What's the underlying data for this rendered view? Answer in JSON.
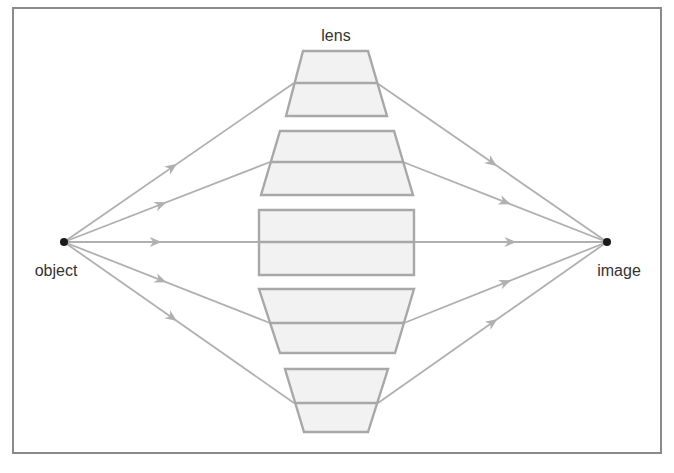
{
  "diagram": {
    "labels": {
      "lens": "lens",
      "object": "object",
      "image": "image"
    },
    "colors": {
      "frame": "#8a8a8a",
      "lens_fill": "#f2f2f2",
      "lens_stroke": "#a8a8a8",
      "ray": "#b0b0b0",
      "point": "#1a1a1a",
      "text": "#333333"
    },
    "lens_segments": [
      {
        "name": "lens-segment-1",
        "shape": "trapezoid-narrow-top"
      },
      {
        "name": "lens-segment-2",
        "shape": "trapezoid-narrow-top"
      },
      {
        "name": "lens-segment-3",
        "shape": "rectangle"
      },
      {
        "name": "lens-segment-4",
        "shape": "trapezoid-narrow-bottom"
      },
      {
        "name": "lens-segment-5",
        "shape": "trapezoid-narrow-bottom"
      }
    ],
    "ray_count": 5,
    "rays_direction": "object-to-image"
  }
}
